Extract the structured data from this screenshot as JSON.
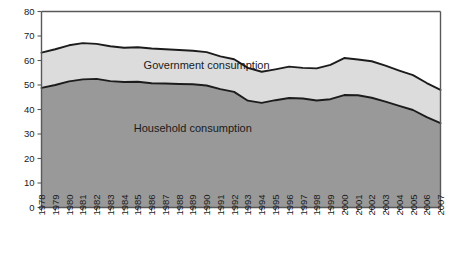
{
  "chart_data": {
    "type": "area",
    "title": "",
    "subtitle": "",
    "xlabel": "",
    "ylabel": "",
    "stacked": true,
    "grid": false,
    "legend_position": "inline-annotation",
    "xlim": [
      1978,
      2007
    ],
    "ylim": [
      0,
      80
    ],
    "ytick_step": 10,
    "ytick_labels": [
      "0",
      "10",
      "20",
      "30",
      "40",
      "50",
      "60",
      "70",
      "80"
    ],
    "ytick_values": [
      0,
      10,
      20,
      30,
      40,
      50,
      60,
      70,
      80
    ],
    "categories": [
      "1978",
      "1979",
      "1980",
      "1981",
      "1982",
      "1983",
      "1984",
      "1985",
      "1986",
      "1987",
      "1988",
      "1989",
      "1990",
      "1991",
      "1992",
      "1993",
      "1994",
      "1995",
      "1996",
      "1997",
      "1998",
      "1999",
      "2000",
      "2001",
      "2002",
      "2003",
      "2004",
      "2005",
      "2006",
      "2007"
    ],
    "series": [
      {
        "name": "Household consumption",
        "color": "#999999",
        "values": [
          48.8,
          50.0,
          51.5,
          52.3,
          52.5,
          51.6,
          51.2,
          51.3,
          50.7,
          50.6,
          50.4,
          50.3,
          49.8,
          48.3,
          47.2,
          43.6,
          42.7,
          43.8,
          44.7,
          44.5,
          43.7,
          44.2,
          45.9,
          45.8,
          44.8,
          43.2,
          41.5,
          39.8,
          36.9,
          34.4
        ]
      },
      {
        "name": "Government consumption",
        "color": "#dcdcdc",
        "values": [
          14.4,
          14.6,
          14.7,
          14.8,
          14.3,
          14.2,
          14.0,
          14.1,
          14.2,
          14.0,
          13.9,
          13.7,
          13.6,
          13.4,
          13.3,
          13.4,
          12.7,
          12.6,
          12.8,
          12.5,
          13.1,
          14.0,
          15.1,
          14.6,
          14.9,
          14.7,
          14.4,
          14.2,
          13.9,
          13.6
        ]
      }
    ],
    "totals": [
      63.2,
      64.6,
      66.2,
      67.1,
      66.8,
      65.8,
      65.2,
      65.4,
      64.9,
      64.6,
      64.3,
      64.0,
      63.4,
      61.7,
      60.5,
      57.0,
      55.4,
      56.4,
      57.5,
      57.0,
      56.8,
      58.2,
      61.0,
      60.4,
      59.7,
      57.9,
      55.9,
      54.0,
      50.8,
      48.0
    ],
    "annotations": [
      {
        "text": "Government consumption",
        "x_year": 1990,
        "y_value": 56.5
      },
      {
        "text": "Household consumption",
        "x_year": 1989,
        "y_value": 31.0
      }
    ],
    "colors": {
      "household_fill": "#999999",
      "government_fill": "#dcdcdc",
      "line": "#1c1c1c",
      "axis": "#595959",
      "background": "#ffffff"
    }
  }
}
